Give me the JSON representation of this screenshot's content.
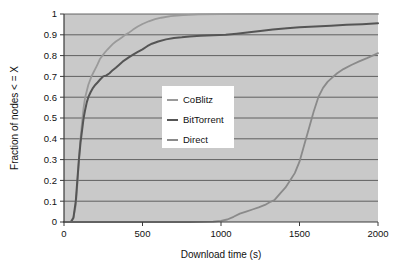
{
  "chart_data": {
    "type": "line",
    "title": "",
    "subtitle": "",
    "xlabel": "Download time (s)",
    "ylabel": "Fraction of nodes < = X",
    "xlim": [
      0,
      2000
    ],
    "ylim": [
      0,
      1
    ],
    "xticks": [
      "0",
      "500",
      "1000",
      "1500",
      "2000"
    ],
    "xtick_values": [
      0,
      500,
      1000,
      1500,
      2000
    ],
    "yticks": [
      "0",
      "0.1",
      "0.2",
      "0.3",
      "0.4",
      "0.5",
      "0.6",
      "0.7",
      "0.8",
      "0.9",
      "1"
    ],
    "ytick_values": [
      0,
      0.1,
      0.2,
      0.3,
      0.4,
      0.5,
      0.6,
      0.7,
      0.8,
      0.9,
      1
    ],
    "grid": "horizontal",
    "legend_position": "center-left",
    "plot_background": "#c9c9c9",
    "figure_background": "#ffffff",
    "axis_color": "#3a3a3a",
    "gridline_color": "#555555",
    "series": [
      {
        "name": "CoBlitz",
        "color": "#9a9a9a",
        "x": [
          0,
          40,
          60,
          75,
          85,
          95,
          105,
          115,
          125,
          135,
          145,
          155,
          165,
          175,
          185,
          195,
          205,
          215,
          230,
          245,
          260,
          275,
          290,
          310,
          330,
          350,
          370,
          390,
          410,
          440,
          470,
          500,
          540,
          580,
          620,
          680,
          760,
          860,
          1000,
          1200,
          1500,
          1800,
          2000
        ],
        "y": [
          0,
          0.0,
          0.02,
          0.08,
          0.18,
          0.3,
          0.4,
          0.48,
          0.55,
          0.6,
          0.63,
          0.66,
          0.68,
          0.7,
          0.715,
          0.73,
          0.745,
          0.76,
          0.785,
          0.8,
          0.815,
          0.828,
          0.84,
          0.855,
          0.868,
          0.878,
          0.888,
          0.9,
          0.908,
          0.925,
          0.94,
          0.952,
          0.965,
          0.975,
          0.982,
          0.99,
          0.995,
          0.998,
          0.999,
          1.0,
          1.0,
          1.0,
          1.0
        ]
      },
      {
        "name": "BitTorrent",
        "color": "#555555",
        "x": [
          0,
          45,
          60,
          75,
          85,
          95,
          105,
          115,
          125,
          135,
          145,
          155,
          170,
          185,
          200,
          215,
          230,
          250,
          270,
          290,
          310,
          330,
          350,
          380,
          410,
          440,
          470,
          500,
          530,
          560,
          600,
          650,
          700,
          750,
          800,
          870,
          950,
          1030,
          1100,
          1180,
          1250,
          1330,
          1420,
          1500,
          1600,
          1700,
          1800,
          1900,
          2000
        ],
        "y": [
          0,
          0.0,
          0.02,
          0.1,
          0.2,
          0.3,
          0.38,
          0.44,
          0.5,
          0.54,
          0.575,
          0.6,
          0.625,
          0.645,
          0.66,
          0.672,
          0.685,
          0.7,
          0.705,
          0.715,
          0.73,
          0.742,
          0.755,
          0.775,
          0.79,
          0.805,
          0.818,
          0.83,
          0.845,
          0.857,
          0.868,
          0.878,
          0.885,
          0.888,
          0.892,
          0.895,
          0.898,
          0.9,
          0.905,
          0.912,
          0.918,
          0.925,
          0.932,
          0.936,
          0.94,
          0.944,
          0.948,
          0.951,
          0.955
        ]
      },
      {
        "name": "Direct",
        "color": "#8a8a8a",
        "x": [
          0,
          200,
          400,
          600,
          800,
          950,
          1000,
          1040,
          1080,
          1120,
          1160,
          1200,
          1240,
          1280,
          1310,
          1340,
          1380,
          1410,
          1440,
          1470,
          1500,
          1530,
          1560,
          1590,
          1620,
          1650,
          1680,
          1710,
          1740,
          1780,
          1830,
          1880,
          1930,
          1980,
          2000
        ],
        "y": [
          0,
          0.0,
          0.0,
          0.0,
          0.0,
          0.002,
          0.005,
          0.012,
          0.025,
          0.04,
          0.05,
          0.06,
          0.07,
          0.082,
          0.095,
          0.105,
          0.14,
          0.165,
          0.2,
          0.235,
          0.29,
          0.37,
          0.45,
          0.53,
          0.6,
          0.645,
          0.675,
          0.695,
          0.715,
          0.735,
          0.755,
          0.772,
          0.788,
          0.805,
          0.812
        ]
      }
    ],
    "legend": {
      "entries": [
        {
          "label": "CoBlitz",
          "color": "#9a9a9a"
        },
        {
          "label": "BitTorrent",
          "color": "#555555"
        },
        {
          "label": "Direct",
          "color": "#8a8a8a"
        }
      ]
    }
  }
}
